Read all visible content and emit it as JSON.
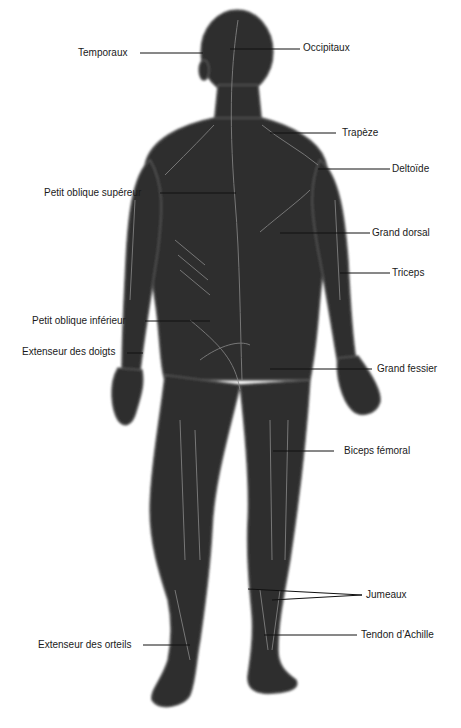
{
  "diagram": {
    "colors": {
      "body": "#2e2e2e",
      "muscle_lines": "#8a8a8a",
      "background": "#ffffff",
      "leader_lines": "#111111",
      "text": "#1a1a1a"
    },
    "labels": {
      "temporaux": "Temporaux",
      "occipitaux": "Occipitaux",
      "trapeze": "Trapèze",
      "deltoide": "Deltoïde",
      "petit_oblique_superieur": "Petit oblique supéreur",
      "grand_dorsal": "Grand dorsal",
      "triceps": "Triceps",
      "petit_oblique_inferieur": "Petit oblique inférieur",
      "extenseur_doigts": "Extenseur des doigts",
      "grand_fessier": "Grand fessier",
      "biceps_femoral": "Biceps fémoral",
      "jumeaux": "Jumeaux",
      "extenseur_orteils": "Extenseur des orteils",
      "tendon_achille": "Tendon d’Achille"
    }
  }
}
